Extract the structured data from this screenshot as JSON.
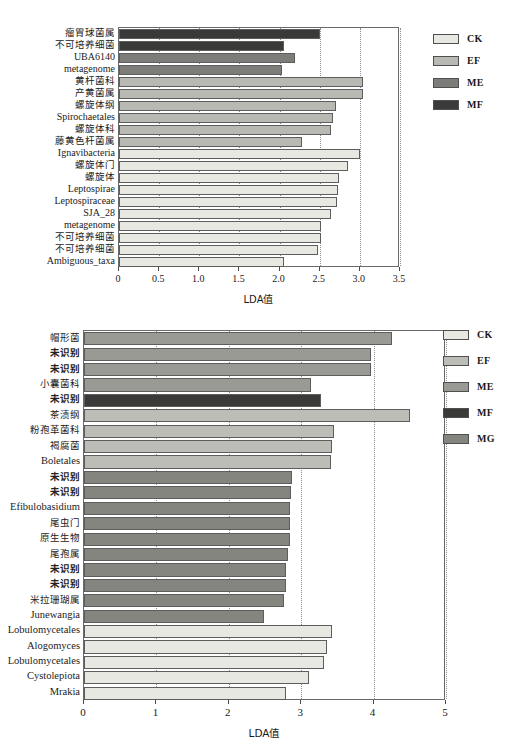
{
  "figure": {
    "charts": [
      {
        "id": "lda-bacteria",
        "axis_title": "LDA值",
        "xlim": [
          0,
          3.5
        ],
        "xticks": [
          "0",
          "0.5",
          "1.0",
          "1.5",
          "2.0",
          "2.5",
          "3.0",
          "3.5"
        ],
        "legend": [
          {
            "label": "CK",
            "color": "#e8e8e2"
          },
          {
            "label": "EF",
            "color": "#b9b9b3"
          },
          {
            "label": "ME",
            "color": "#7c7c78"
          },
          {
            "label": "MF",
            "color": "#3a3a38"
          }
        ],
        "chart_data": {
          "type": "bar",
          "orientation": "horizontal",
          "title": "",
          "xlabel": "LDA值",
          "ylabel": "",
          "xlim": [
            0,
            3.5
          ],
          "grid": true,
          "legend_position": "right",
          "categories": [
            "瘤胃球菌属",
            "不可培养细菌",
            "UBA6140",
            "metagenome",
            "黄杆菌科",
            "产黄菌属",
            "螺旋体纲",
            "Spirochaetales",
            "螺旋体科",
            "藤黄色杆菌属",
            "Ignavibacteria",
            "螺旋体门",
            "螺旋体",
            "Leptospirae",
            "Leptospiraceae",
            "SJA_28",
            "metagenome",
            "不可培养细菌",
            "不可培养细菌",
            "Ambiguous_taxa"
          ],
          "values": [
            2.5,
            2.06,
            2.19,
            2.03,
            3.04,
            3.04,
            2.7,
            2.66,
            2.64,
            2.28,
            3.0,
            2.85,
            2.74,
            2.73,
            2.71,
            2.64,
            2.52,
            2.51,
            2.48,
            2.06
          ],
          "groups": [
            "MF",
            "MF",
            "ME",
            "ME",
            "EF",
            "EF",
            "EF",
            "EF",
            "EF",
            "EF",
            "CK",
            "CK",
            "CK",
            "CK",
            "CK",
            "CK",
            "CK",
            "CK",
            "CK",
            "CK"
          ]
        }
      },
      {
        "id": "lda-fungi",
        "axis_title": "LDA值",
        "xlim": [
          0,
          5
        ],
        "xticks": [
          "0",
          "1",
          "2",
          "3",
          "4",
          "5"
        ],
        "legend": [
          {
            "label": "CK",
            "color": "#e8e8e2"
          },
          {
            "label": "EF",
            "color": "#bdbdb7"
          },
          {
            "label": "ME",
            "color": "#9a9a95"
          },
          {
            "label": "MF",
            "color": "#3a3a38"
          },
          {
            "label": "MG",
            "color": "#85857f"
          }
        ],
        "chart_data": {
          "type": "bar",
          "orientation": "horizontal",
          "title": "",
          "xlabel": "LDA值",
          "ylabel": "",
          "xlim": [
            0,
            5
          ],
          "grid": true,
          "legend_position": "right",
          "categories": [
            "帽形菌",
            "未识别",
            "未识别",
            "小囊菌科",
            "未识别",
            "茶渍纲",
            "粉孢革菌科",
            "褐腐菌",
            "Boletales",
            "未识别",
            "未识别",
            "Efibulobasidium",
            "尾虫门",
            "原生生物",
            "尾孢属",
            "未识别",
            "未识别",
            "米拉珊瑚属",
            "Junewangia",
            "Lobulomycetales",
            "Alogomyces",
            "Lobulomycetales",
            "Cystolepiota",
            "Mrakia"
          ],
          "values": [
            4.26,
            3.97,
            3.96,
            3.14,
            3.28,
            4.5,
            3.45,
            3.42,
            3.41,
            2.87,
            2.86,
            2.85,
            2.84,
            2.84,
            2.82,
            2.79,
            2.79,
            2.76,
            2.48,
            3.43,
            3.36,
            3.31,
            3.11,
            2.79
          ],
          "groups": [
            "ME",
            "ME",
            "ME",
            "ME",
            "MF",
            "EF",
            "EF",
            "EF",
            "EF",
            "MG",
            "MG",
            "MG",
            "MG",
            "MG",
            "MG",
            "MG",
            "MG",
            "MG",
            "MG",
            "CK",
            "CK",
            "CK",
            "CK",
            "CK"
          ],
          "bold_labels": [
            false,
            true,
            true,
            false,
            true,
            false,
            false,
            false,
            false,
            true,
            true,
            false,
            false,
            false,
            false,
            true,
            true,
            false,
            false,
            false,
            false,
            false,
            false,
            false
          ]
        }
      }
    ]
  }
}
